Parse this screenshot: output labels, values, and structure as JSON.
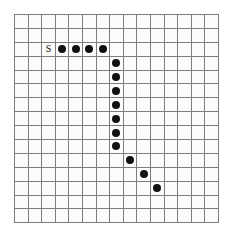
{
  "figure": {
    "kind": "grid-path-puzzle",
    "background_color": "#ffffff",
    "grid_background_color": "#fbfbfa",
    "gridline_color": "#7d7d7d",
    "marker_color": "#111111"
  },
  "grid": {
    "columns": 15,
    "rows": 15,
    "cell_width_px": 13.6,
    "cell_height_px": 13.9,
    "origin_x_px": 14,
    "origin_y_px": 14
  },
  "labels": [
    {
      "name": "start-label",
      "text": "S",
      "row": 2,
      "col": 2
    }
  ],
  "dots": [
    {
      "row": 2,
      "col": 3
    },
    {
      "row": 2,
      "col": 4
    },
    {
      "row": 2,
      "col": 5
    },
    {
      "row": 2,
      "col": 6
    },
    {
      "row": 3,
      "col": 7
    },
    {
      "row": 4,
      "col": 7
    },
    {
      "row": 5,
      "col": 7
    },
    {
      "row": 6,
      "col": 7
    },
    {
      "row": 7,
      "col": 7
    },
    {
      "row": 8,
      "col": 7
    },
    {
      "row": 9,
      "col": 7
    },
    {
      "row": 10,
      "col": 8
    },
    {
      "row": 11,
      "col": 9
    },
    {
      "row": 12,
      "col": 10
    }
  ]
}
